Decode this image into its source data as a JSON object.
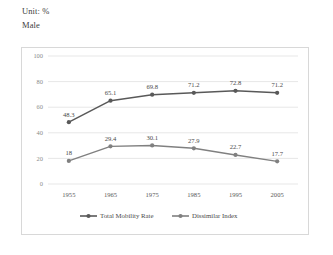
{
  "caption": {
    "unit": "Unit: %",
    "group": "Male"
  },
  "chart_data": {
    "type": "line",
    "title": "",
    "subtitle": "",
    "xlabel": "",
    "ylabel": "",
    "categories": [
      "1955",
      "1965",
      "1975",
      "1985",
      "1995",
      "2005"
    ],
    "series": [
      {
        "name": "Total Mobility Rate",
        "values": [
          48.3,
          65.1,
          69.8,
          71.2,
          72.8,
          71.2
        ],
        "color": "#595959",
        "marker": "circle"
      },
      {
        "name": "Dissimilar Index",
        "values": [
          18,
          29.4,
          30.1,
          27.9,
          22.7,
          17.7
        ],
        "color": "#808080",
        "marker": "circle"
      }
    ],
    "ylim": [
      0,
      100
    ],
    "yticks": [
      "0",
      "20",
      "40",
      "60",
      "80",
      "100"
    ],
    "grid": true,
    "legend_position": "bottom",
    "data_labels": true
  },
  "colors": {
    "frame": "#d8d8d8",
    "gridline": "#dcdcdc",
    "series_1": "#595959",
    "series_2": "#808080",
    "text": "#4a4a4a"
  }
}
